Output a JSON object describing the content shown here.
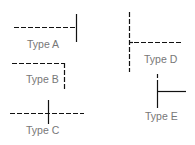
{
  "diagram": {
    "colors": {
      "line": "#111111",
      "label": "#777777",
      "background": "#ffffff"
    },
    "items": [
      {
        "id": "A",
        "label": "Type A",
        "description": "dashed horizontal line ending at a solid vertical line (T on right)"
      },
      {
        "id": "B",
        "label": "Type B",
        "description": "dashed horizontal line turning down into dashed vertical (corner)"
      },
      {
        "id": "C",
        "label": "Type C",
        "description": "dashed horizontal line crossed by a solid vertical line"
      },
      {
        "id": "D",
        "label": "Type D",
        "description": "dashed vertical line with dashed horizontal branch to the right"
      },
      {
        "id": "E",
        "label": "Type E",
        "description": "solid vertical line with solid horizontal branch to the right"
      }
    ]
  }
}
